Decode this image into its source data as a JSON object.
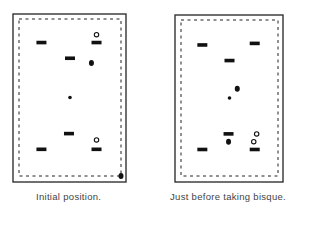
{
  "panels": [
    {
      "id": "initial",
      "caption": "Initial position.",
      "court": {
        "units": "fraction of inner boundary (x: 0=left,1=right; y: 0=top,1=bottom)"
      },
      "hoops": [
        {
          "name": "hoop-top-left",
          "x": 0.22,
          "y": 0.15
        },
        {
          "name": "hoop-top-right",
          "x": 0.76,
          "y": 0.15
        },
        {
          "name": "hoop-center-upper",
          "x": 0.5,
          "y": 0.25
        },
        {
          "name": "hoop-center-lower",
          "x": 0.49,
          "y": 0.73
        },
        {
          "name": "hoop-bottom-left",
          "x": 0.22,
          "y": 0.83
        },
        {
          "name": "hoop-bottom-right",
          "x": 0.76,
          "y": 0.83
        }
      ],
      "pegs": [
        {
          "name": "center-peg",
          "x": 0.5,
          "y": 0.5
        }
      ],
      "black_balls": [
        {
          "name": "black-ball",
          "x": 0.71,
          "y": 0.28
        },
        {
          "name": "black-ball-corner",
          "x": 1.0,
          "y": 1.0
        }
      ],
      "open_balls": [
        {
          "name": "open-ball",
          "x": 0.76,
          "y": 0.1
        },
        {
          "name": "open-ball",
          "x": 0.76,
          "y": 0.77
        }
      ]
    },
    {
      "id": "before-bisque",
      "caption": "Just before taking bisque.",
      "court": {
        "units": "fraction of inner boundary (x: 0=left,1=right; y: 0=top,1=bottom)"
      },
      "hoops": [
        {
          "name": "hoop-top-left",
          "x": 0.22,
          "y": 0.16
        },
        {
          "name": "hoop-top-right",
          "x": 0.76,
          "y": 0.15
        },
        {
          "name": "hoop-center-upper",
          "x": 0.5,
          "y": 0.26
        },
        {
          "name": "hoop-center-lower",
          "x": 0.49,
          "y": 0.73
        },
        {
          "name": "hoop-bottom-left",
          "x": 0.22,
          "y": 0.83
        },
        {
          "name": "hoop-bottom-right",
          "x": 0.76,
          "y": 0.83
        }
      ],
      "pegs": [
        {
          "name": "center-peg",
          "x": 0.5,
          "y": 0.5
        }
      ],
      "black_balls": [
        {
          "name": "black-ball",
          "x": 0.58,
          "y": 0.44
        },
        {
          "name": "black-ball",
          "x": 0.49,
          "y": 0.78
        }
      ],
      "open_balls": [
        {
          "name": "open-ball",
          "x": 0.78,
          "y": 0.73
        },
        {
          "name": "open-ball",
          "x": 0.75,
          "y": 0.78
        }
      ]
    }
  ]
}
